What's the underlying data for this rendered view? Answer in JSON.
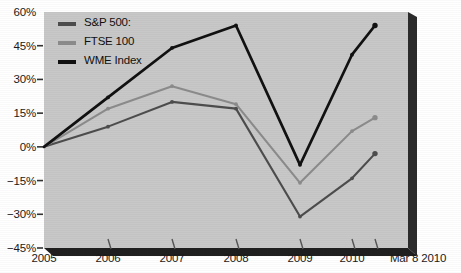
{
  "chart_data": {
    "type": "line",
    "title": "",
    "xlabel": "",
    "ylabel": "",
    "x": [
      "2005",
      "2006",
      "2007",
      "2008",
      "2009",
      "2010",
      "Mar 8 2010"
    ],
    "categories": [
      "2005",
      "2006",
      "2007",
      "2008",
      "2009",
      "2010",
      "Mar 8 2010"
    ],
    "series": [
      {
        "name": "S&P 500:",
        "color": "#4d4d4d",
        "values": [
          0,
          9,
          20,
          17,
          -31,
          -14,
          -3
        ]
      },
      {
        "name": "FTSE 100",
        "color": "#8c8c8c",
        "values": [
          0,
          17,
          27,
          19,
          -16,
          7,
          13
        ]
      },
      {
        "name": "WME Index",
        "color": "#111111",
        "values": [
          0,
          22,
          44,
          54,
          -8,
          41,
          54
        ]
      }
    ],
    "ylim": [
      -45,
      60
    ],
    "yticks": [
      60,
      45,
      30,
      15,
      0,
      -15,
      -30,
      -45
    ],
    "ytick_labels": [
      "60%",
      "45%",
      "30%",
      "15%",
      "0%",
      "−15%",
      "−30%",
      "−45%"
    ],
    "grid": false,
    "legend_position": "top-left",
    "plot_background": "#c8c8c8",
    "figure_background": "#ffffff"
  },
  "legend": {
    "items": [
      {
        "label": "S&P 500:"
      },
      {
        "label": "FTSE 100"
      },
      {
        "label": "WME Index"
      }
    ]
  },
  "axes": {
    "y_labels": [
      "60%",
      "45%",
      "30%",
      "15%",
      "0%",
      "−15%",
      "−30%",
      "−45%"
    ],
    "x_labels": [
      "2005",
      "2006",
      "2007",
      "2008",
      "2009",
      "2010",
      "Mar 8 2010"
    ]
  }
}
